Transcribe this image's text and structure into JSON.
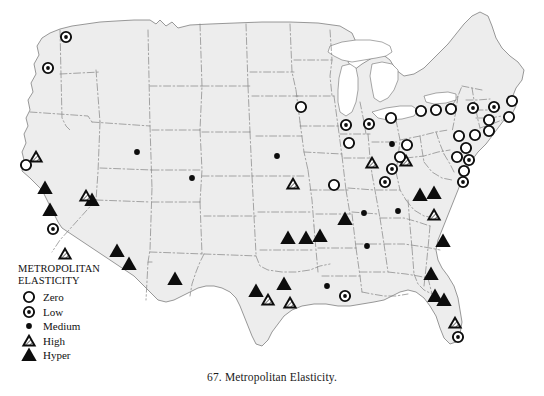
{
  "figure": {
    "caption": "67. Metropolitan Elasticity.",
    "title": "Metropolitan Elasticity"
  },
  "legend": {
    "title": "METROPOLITAN\nELASTICITY",
    "items": [
      {
        "key": "zero",
        "label": "Zero",
        "symbol": "open-circle"
      },
      {
        "key": "low",
        "label": "Low",
        "symbol": "dotted-circle"
      },
      {
        "key": "medium",
        "label": "Medium",
        "symbol": "filled-dot"
      },
      {
        "key": "high",
        "label": "High",
        "symbol": "hatched-triangle"
      },
      {
        "key": "hyper",
        "label": "Hyper",
        "symbol": "filled-triangle"
      }
    ]
  },
  "colors": {
    "land_fill": "#ededed",
    "water_fill": "#ffffff",
    "state_border": "#8a8a8a",
    "coast_border": "#6e6e6e",
    "marker_ink": "#0d0d0d",
    "page_background": "#ffffff",
    "text": "#111111"
  },
  "map": {
    "region": "Contiguous United States",
    "projection_note": "albers-like",
    "markers": [
      {
        "id": "m01",
        "class": "low",
        "x": 66,
        "y": 37
      },
      {
        "id": "m02",
        "class": "low",
        "x": 48,
        "y": 68
      },
      {
        "id": "m03",
        "class": "high",
        "x": 36,
        "y": 157
      },
      {
        "id": "m04",
        "class": "zero",
        "x": 26,
        "y": 165
      },
      {
        "id": "m05",
        "class": "hyper",
        "x": 45,
        "y": 188
      },
      {
        "id": "m06",
        "class": "hyper",
        "x": 50,
        "y": 210
      },
      {
        "id": "m07",
        "class": "low",
        "x": 53,
        "y": 229
      },
      {
        "id": "m08",
        "class": "high",
        "x": 65,
        "y": 254
      },
      {
        "id": "m09",
        "class": "hyper",
        "x": 92,
        "y": 200
      },
      {
        "id": "m10",
        "class": "high",
        "x": 86,
        "y": 196
      },
      {
        "id": "m11",
        "class": "medium",
        "x": 137,
        "y": 152
      },
      {
        "id": "m12",
        "class": "hyper",
        "x": 117,
        "y": 251
      },
      {
        "id": "m13",
        "class": "hyper",
        "x": 129,
        "y": 264
      },
      {
        "id": "m14",
        "class": "medium",
        "x": 192,
        "y": 178
      },
      {
        "id": "m15",
        "class": "hyper",
        "x": 175,
        "y": 279
      },
      {
        "id": "m16",
        "class": "medium",
        "x": 277,
        "y": 156
      },
      {
        "id": "m17",
        "class": "high",
        "x": 293,
        "y": 184
      },
      {
        "id": "m18",
        "class": "hyper",
        "x": 256,
        "y": 291
      },
      {
        "id": "m19",
        "class": "high",
        "x": 268,
        "y": 300
      },
      {
        "id": "m20",
        "class": "hyper",
        "x": 284,
        "y": 284
      },
      {
        "id": "m21",
        "class": "high",
        "x": 290,
        "y": 303
      },
      {
        "id": "m22",
        "class": "hyper",
        "x": 288,
        "y": 238
      },
      {
        "id": "m23",
        "class": "hyper",
        "x": 306,
        "y": 238
      },
      {
        "id": "m24",
        "class": "hyper",
        "x": 320,
        "y": 236
      },
      {
        "id": "m25",
        "class": "zero",
        "x": 301,
        "y": 107
      },
      {
        "id": "m26",
        "class": "low",
        "x": 346,
        "y": 125
      },
      {
        "id": "m27",
        "class": "low",
        "x": 369,
        "y": 124
      },
      {
        "id": "m28",
        "class": "zero",
        "x": 349,
        "y": 143
      },
      {
        "id": "m29",
        "class": "zero",
        "x": 334,
        "y": 185
      },
      {
        "id": "m30",
        "class": "high",
        "x": 372,
        "y": 163
      },
      {
        "id": "m31",
        "class": "medium",
        "x": 392,
        "y": 144
      },
      {
        "id": "m32",
        "class": "zero",
        "x": 407,
        "y": 145
      },
      {
        "id": "m33",
        "class": "zero",
        "x": 391,
        "y": 118
      },
      {
        "id": "m34",
        "class": "low",
        "x": 392,
        "y": 169
      },
      {
        "id": "m35",
        "class": "low",
        "x": 385,
        "y": 182
      },
      {
        "id": "m36",
        "class": "high",
        "x": 406,
        "y": 161
      },
      {
        "id": "m37",
        "class": "zero",
        "x": 400,
        "y": 157
      },
      {
        "id": "m38",
        "class": "low",
        "x": 345,
        "y": 296
      },
      {
        "id": "m39",
        "class": "medium",
        "x": 327,
        "y": 286
      },
      {
        "id": "m40",
        "class": "hyper",
        "x": 345,
        "y": 219
      },
      {
        "id": "m41",
        "class": "medium",
        "x": 364,
        "y": 213
      },
      {
        "id": "m42",
        "class": "medium",
        "x": 367,
        "y": 246
      },
      {
        "id": "m43",
        "class": "medium",
        "x": 398,
        "y": 211
      },
      {
        "id": "m44",
        "class": "high",
        "x": 434,
        "y": 215
      },
      {
        "id": "m45",
        "class": "hyper",
        "x": 420,
        "y": 195
      },
      {
        "id": "m46",
        "class": "hyper",
        "x": 434,
        "y": 193
      },
      {
        "id": "m47",
        "class": "hyper",
        "x": 443,
        "y": 241
      },
      {
        "id": "m48",
        "class": "hyper",
        "x": 431,
        "y": 274
      },
      {
        "id": "m49",
        "class": "hyper",
        "x": 435,
        "y": 296
      },
      {
        "id": "m50",
        "class": "hyper",
        "x": 444,
        "y": 300
      },
      {
        "id": "m51",
        "class": "high",
        "x": 455,
        "y": 323
      },
      {
        "id": "m52",
        "class": "low",
        "x": 458,
        "y": 337
      },
      {
        "id": "m53",
        "class": "zero",
        "x": 421,
        "y": 111
      },
      {
        "id": "m54",
        "class": "zero",
        "x": 436,
        "y": 110
      },
      {
        "id": "m55",
        "class": "zero",
        "x": 451,
        "y": 109
      },
      {
        "id": "m56",
        "class": "low",
        "x": 473,
        "y": 108
      },
      {
        "id": "m57",
        "class": "low",
        "x": 494,
        "y": 107
      },
      {
        "id": "m58",
        "class": "zero",
        "x": 512,
        "y": 101
      },
      {
        "id": "m59",
        "class": "zero",
        "x": 509,
        "y": 117
      },
      {
        "id": "m60",
        "class": "zero",
        "x": 489,
        "y": 120
      },
      {
        "id": "m61",
        "class": "zero",
        "x": 489,
        "y": 131
      },
      {
        "id": "m62",
        "class": "zero",
        "x": 475,
        "y": 135
      },
      {
        "id": "m63",
        "class": "zero",
        "x": 459,
        "y": 136
      },
      {
        "id": "m64",
        "class": "zero",
        "x": 466,
        "y": 148
      },
      {
        "id": "m65",
        "class": "zero",
        "x": 457,
        "y": 157
      },
      {
        "id": "m66",
        "class": "low",
        "x": 469,
        "y": 160
      },
      {
        "id": "m67",
        "class": "zero",
        "x": 464,
        "y": 171
      },
      {
        "id": "m68",
        "class": "low",
        "x": 463,
        "y": 182
      }
    ]
  }
}
